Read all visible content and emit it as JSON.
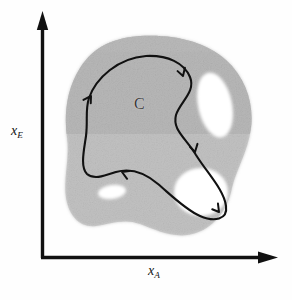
{
  "figure": {
    "background_color": "#fefefe",
    "ink_color": "#141414"
  },
  "axes": {
    "origin": {
      "x": 42,
      "y": 258
    },
    "y_axis": {
      "label_base": "x",
      "label_subscript": "E",
      "label_full": "x_E",
      "arrow": "arrow-up",
      "line_color": "#111111",
      "line_width": 3.2,
      "tip_y": 12
    },
    "x_axis": {
      "label_base": "x",
      "label_subscript": "A",
      "label_full": "x_A",
      "arrow": "arrow-right",
      "line_color": "#111111",
      "line_width": 3.2,
      "tip_x": 278
    }
  },
  "region": {
    "name": "C",
    "label": "C",
    "label_color": "#3a3a3a",
    "fill_color_light": "#c9c9c9",
    "fill_color_dark": "#b0b0b0",
    "edge_softness": "grainy",
    "bounds": {
      "left": 64,
      "top": 36,
      "right": 252,
      "bottom": 236
    },
    "band": {
      "description": "darker horizontal band across upper half",
      "top": 36,
      "bottom": 133,
      "color": "#b0b0b0"
    },
    "holes": [
      {
        "name": "hole-upper-right",
        "shape": "elongated-oval",
        "center_x": 215,
        "center_y": 105,
        "radius_x": 17,
        "radius_y": 33,
        "rotation_deg": -12,
        "fill": "#ffffff"
      },
      {
        "name": "hole-lower-right",
        "shape": "round",
        "center_x": 201,
        "center_y": 192,
        "radius_x": 27,
        "radius_y": 24,
        "rotation_deg": 0,
        "fill": "#ffffff"
      },
      {
        "name": "hole-lower-left",
        "shape": "small-oval",
        "center_x": 112,
        "center_y": 192,
        "radius_x": 14,
        "radius_y": 7,
        "rotation_deg": -8,
        "fill": "#ffffff"
      }
    ]
  },
  "trajectory": {
    "name": "closed-loop-trajectory",
    "direction": "clockwise",
    "stroke_color": "#111111",
    "stroke_width": 2.1,
    "closed": true,
    "arrowheads": [
      {
        "name": "arrow-top-right",
        "x": 181,
        "y": 74,
        "angle_deg": 62
      },
      {
        "name": "arrow-mid-right",
        "x": 196,
        "y": 152,
        "angle_deg": 58
      },
      {
        "name": "arrow-bottom-right",
        "x": 216,
        "y": 215,
        "angle_deg": 160
      },
      {
        "name": "arrow-mid-left",
        "x": 123,
        "y": 172,
        "angle_deg": 186
      },
      {
        "name": "arrow-upper-left",
        "x": 93,
        "y": 93,
        "angle_deg": -70
      }
    ]
  }
}
